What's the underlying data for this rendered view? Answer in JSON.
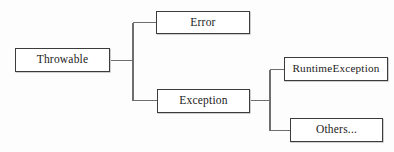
{
  "diagram": {
    "type": "tree-diagram",
    "background_color": "#fdfdfd",
    "box_border_color": "#3c3c3c",
    "connector_color": "#6e6e6e",
    "text_color": "#1b1b1b",
    "nodes": [
      {
        "id": "throwable",
        "label": "Throwable",
        "x": 15,
        "y": 48,
        "width": 95,
        "height": 24
      },
      {
        "id": "error",
        "label": "Error",
        "x": 156,
        "y": 11,
        "width": 94,
        "height": 23
      },
      {
        "id": "exception",
        "label": "Exception",
        "x": 157,
        "y": 89,
        "width": 93,
        "height": 24
      },
      {
        "id": "runtimeexception",
        "label": "RuntimeException",
        "x": 284,
        "y": 57,
        "width": 104,
        "height": 24
      },
      {
        "id": "others",
        "label": "Others...",
        "x": 290,
        "y": 118,
        "width": 93,
        "height": 24
      }
    ],
    "edges": [
      {
        "from": "throwable",
        "to": "error"
      },
      {
        "from": "throwable",
        "to": "exception"
      },
      {
        "from": "exception",
        "to": "runtimeexception"
      },
      {
        "from": "exception",
        "to": "others"
      }
    ]
  }
}
